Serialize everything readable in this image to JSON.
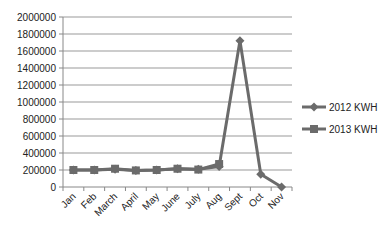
{
  "chart_data": {
    "type": "line",
    "title": "",
    "xlabel": "",
    "ylabel": "",
    "categories": [
      "Jan",
      "Feb",
      "March",
      "April",
      "May",
      "June",
      "July",
      "Aug",
      "Sept",
      "Oct",
      "Nov"
    ],
    "series": [
      {
        "name": "2012 KWH",
        "marker": "diamond",
        "values": [
          200000,
          200000,
          210000,
          195000,
          200000,
          215000,
          210000,
          240000,
          1720000,
          150000,
          0
        ]
      },
      {
        "name": "2013 KWH",
        "marker": "square",
        "values": [
          200000,
          200000,
          215000,
          195000,
          200000,
          215000,
          205000,
          270000,
          null,
          null,
          null
        ]
      }
    ],
    "yticks": [
      "2000000",
      "1800000",
      "1600000",
      "1400000",
      "1200000",
      "1000000",
      "800000",
      "600000",
      "400000",
      "200000",
      "0"
    ],
    "ylim": [
      0,
      2000000
    ],
    "grid": true,
    "legend_position": "right",
    "colors": {
      "line": "#6b6b6b",
      "grid": "#999999",
      "axis": "#888888"
    }
  }
}
